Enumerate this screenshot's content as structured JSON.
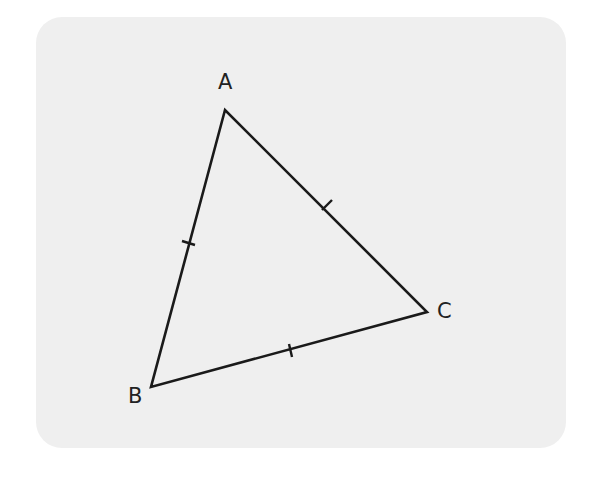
{
  "diagram": {
    "type": "triangle",
    "vertices": [
      {
        "label": "A",
        "x": 225,
        "y": 110
      },
      {
        "label": "B",
        "x": 151,
        "y": 387
      },
      {
        "label": "C",
        "x": 427,
        "y": 312
      }
    ],
    "equal_side_marks": [
      "AB",
      "AC",
      "BC"
    ],
    "colors": {
      "stroke": "#1a1a1a",
      "card": "#efefef",
      "background": "#ffffff"
    }
  }
}
